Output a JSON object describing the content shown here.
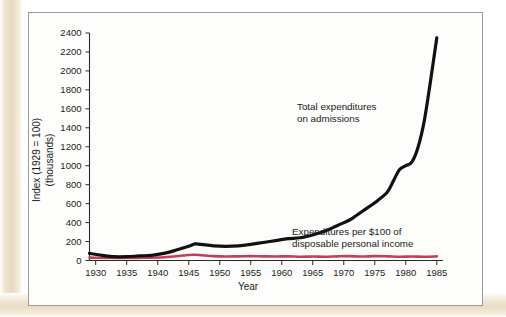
{
  "chart_data": {
    "type": "line",
    "title": "",
    "xlabel": "Year",
    "ylabel": "Index (1929 = 100)",
    "ylabel_line2": "(thousands)",
    "xlim": [
      1929,
      1986
    ],
    "ylim": [
      0,
      2400
    ],
    "grid": false,
    "legend": "annotations-inline",
    "xticks": [
      1930,
      1935,
      1940,
      1945,
      1950,
      1955,
      1960,
      1965,
      1970,
      1975,
      1980,
      1985
    ],
    "yticks": [
      0,
      200,
      400,
      600,
      800,
      1000,
      1200,
      1400,
      1600,
      1800,
      2000,
      2200,
      2400
    ],
    "series": [
      {
        "name": "Total expenditures on admissions",
        "color": "#111111",
        "annotation": "Total expenditures on admissions",
        "x": [
          1929,
          1931,
          1933,
          1935,
          1937,
          1939,
          1941,
          1943,
          1945,
          1946,
          1947,
          1949,
          1951,
          1953,
          1955,
          1957,
          1959,
          1961,
          1963,
          1965,
          1967,
          1969,
          1971,
          1973,
          1975,
          1977,
          1978,
          1979,
          1980,
          1981,
          1982,
          1983,
          1984,
          1985
        ],
        "values": [
          75,
          55,
          40,
          40,
          48,
          55,
          75,
          110,
          150,
          175,
          170,
          155,
          150,
          155,
          170,
          190,
          210,
          230,
          240,
          270,
          310,
          370,
          430,
          520,
          610,
          720,
          840,
          960,
          1000,
          1040,
          1200,
          1480,
          1900,
          2350
        ]
      },
      {
        "name": "Expenditures per $100 of disposable personal income",
        "color": "#c0405a",
        "annotation": "Expenditures per $100 of disposable personal income",
        "x": [
          1929,
          1933,
          1937,
          1941,
          1944,
          1945,
          1946,
          1947,
          1949,
          1951,
          1953,
          1955,
          1957,
          1959,
          1961,
          1963,
          1965,
          1967,
          1969,
          1971,
          1973,
          1975,
          1977,
          1979,
          1981,
          1983,
          1985
        ],
        "values": [
          30,
          26,
          28,
          34,
          52,
          58,
          60,
          56,
          46,
          42,
          44,
          46,
          44,
          42,
          44,
          40,
          42,
          40,
          44,
          46,
          42,
          46,
          44,
          40,
          42,
          40,
          44
        ]
      }
    ],
    "annotations": [
      {
        "id": "annot-total-expenditures",
        "line1": "Total expenditures",
        "line2": "on admissions",
        "x": 297,
        "y": 110
      },
      {
        "id": "annot-per-100-income",
        "line1": "Expenditures per $100 of",
        "line2": "disposable personal income",
        "x": 292,
        "y": 235
      }
    ]
  },
  "axis": {
    "x_title": "Year",
    "y_title_line1": "Index (1929 = 100)",
    "y_title_line2": "(thousands)"
  },
  "colors": {
    "series_black": "#111111",
    "series_red": "#c0405a",
    "frame": "#9a9a9a",
    "page_band": "#e8dabf",
    "axis": "#2b2b2b"
  }
}
